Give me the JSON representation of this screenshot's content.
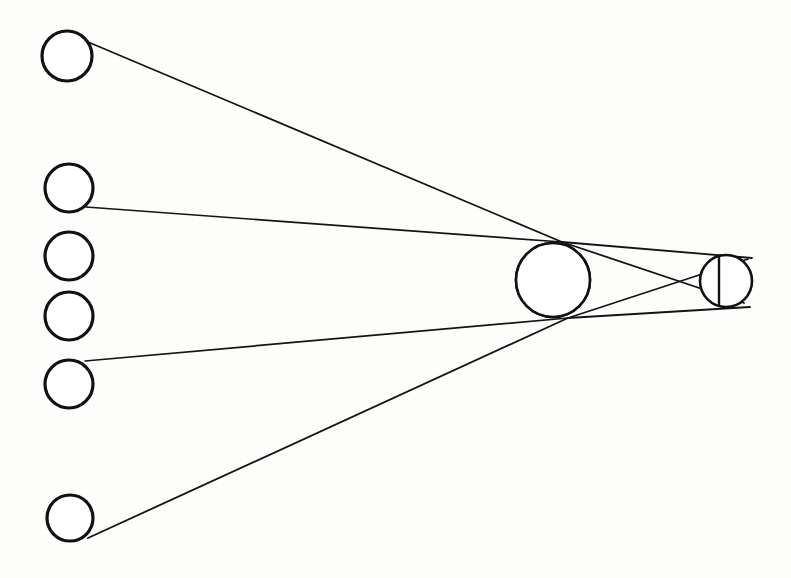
{
  "figure": {
    "background_color": "#fdfdfb",
    "ink_color": "#111111",
    "canvas": {
      "width": 791,
      "height": 578
    }
  },
  "source_circles": [
    {
      "name": "source-circle-1",
      "label": "1",
      "cx": 67,
      "cy": 56,
      "r": 25,
      "has_ray": true
    },
    {
      "name": "source-circle-2",
      "label": "2",
      "cx": 69,
      "cy": 188,
      "r": 24,
      "has_ray": true
    },
    {
      "name": "source-circle-3",
      "label": "3",
      "cx": 69,
      "cy": 256,
      "r": 24,
      "has_ray": false
    },
    {
      "name": "source-circle-4",
      "label": "4",
      "cx": 69,
      "cy": 316,
      "r": 24,
      "has_ray": false
    },
    {
      "name": "source-circle-5",
      "label": "5",
      "cx": 69,
      "cy": 384,
      "r": 24,
      "has_ray": true
    },
    {
      "name": "source-circle-6",
      "label": "6",
      "cx": 70,
      "cy": 518,
      "r": 23,
      "has_ray": true
    }
  ],
  "hatched_circle": {
    "name": "hatched-sphere",
    "cx": 553,
    "cy": 280,
    "r": 37,
    "divider_x": 570,
    "hatch_spacing": 4,
    "hatch_orientation": "vertical",
    "fill_color": "#ffffff",
    "hatch_color": "#121212"
  },
  "small_circle": {
    "name": "small-sphere",
    "cx": 726,
    "cy": 281,
    "r": 26,
    "divider_x": 719,
    "fill_color": "#ffffff"
  },
  "convergence_points": {
    "top_node": {
      "x": 562,
      "y": 242
    },
    "bottom_node": {
      "x": 568,
      "y": 318
    },
    "cross_node": {
      "x": 645,
      "y": 281
    }
  },
  "rays": [
    {
      "name": "ray-from-source-1-to-top-node",
      "x1": 88,
      "y1": 42,
      "x2": 562,
      "y2": 242,
      "width": 1.7
    },
    {
      "name": "ray-from-source-2-to-top-node",
      "x1": 86,
      "y1": 207,
      "x2": 562,
      "y2": 242,
      "width": 1.7
    },
    {
      "name": "ray-from-source-5-to-bottom-node",
      "x1": 85,
      "y1": 361,
      "x2": 568,
      "y2": 318,
      "width": 1.7
    },
    {
      "name": "ray-from-source-6-to-bottom-node",
      "x1": 88,
      "y1": 538,
      "x2": 568,
      "y2": 318,
      "width": 1.8
    },
    {
      "name": "ray-top-node-to-small-upper",
      "x1": 562,
      "y1": 242,
      "x2": 752,
      "y2": 258,
      "width": 1.8
    },
    {
      "name": "ray-top-node-to-small-lower",
      "x1": 562,
      "y1": 242,
      "x2": 744,
      "y2": 303,
      "width": 1.8
    },
    {
      "name": "ray-bottom-node-to-small-upper",
      "x1": 568,
      "y1": 318,
      "x2": 748,
      "y2": 259,
      "width": 1.8
    },
    {
      "name": "ray-bottom-node-to-small-lower",
      "x1": 568,
      "y1": 318,
      "x2": 750,
      "y2": 307,
      "width": 1.8
    }
  ],
  "chart_data": {
    "type": "diagram",
    "xlabel": "",
    "ylabel": "",
    "elements": {
      "source_circle_count": 6,
      "hatched_circle_count": 1,
      "small_circle_count": 1,
      "ray_count": 8
    }
  }
}
